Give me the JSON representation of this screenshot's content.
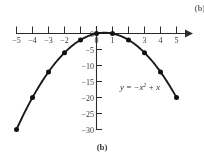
{
  "figure": {
    "part_label_top": "(b)",
    "part_label_bottom": "(b)",
    "equation_lead": "y = −x",
    "equation_exp": "2",
    "equation_tail": " + x"
  },
  "chart_data": {
    "type": "line",
    "title": "",
    "subtitle": "",
    "xlabel": "",
    "ylabel": "",
    "equation": "y = -x^2 + x",
    "grid": false,
    "legend": "none",
    "annotations": [
      {
        "text": "y = −x² + x",
        "x": 2.1,
        "y": -14.5
      },
      {
        "text": "(b)",
        "x": null,
        "y": null
      }
    ],
    "xlim": [
      -5,
      5.9
    ],
    "ylim": [
      -31.5,
      1.5
    ],
    "xticks": [
      -5,
      -4,
      -3,
      -2,
      -1,
      0,
      1,
      2,
      3,
      4,
      5
    ],
    "xticklabels": [
      "-5",
      "-4",
      "-3",
      "-2",
      "",
      "0",
      "1",
      "",
      "3",
      "4",
      "5"
    ],
    "yticks": [
      0,
      -5,
      -10,
      -15,
      -20,
      -25,
      -30
    ],
    "yticklabels": [
      "0",
      "-5",
      "-10",
      "-15",
      "-20",
      "-25",
      "-30"
    ],
    "x_axis_arrow": "right",
    "y_axis_arrow": "none",
    "markers": "filled-circle",
    "x": [
      -5,
      -4,
      -3,
      -2,
      -1,
      0,
      1,
      2,
      3,
      4,
      5
    ],
    "values": [
      -30,
      -20,
      -12,
      -6,
      -2,
      0,
      0,
      -2,
      -6,
      -12,
      -20
    ],
    "series": [
      {
        "name": "y = -x^2 + x",
        "x": [
          -5,
          -4,
          -3,
          -2,
          -1,
          0,
          1,
          2,
          3,
          4,
          5
        ],
        "values": [
          -30,
          -20,
          -12,
          -6,
          -2,
          0,
          0,
          -2,
          -6,
          -12,
          -20
        ]
      }
    ],
    "vertex": {
      "x": 0.5,
      "y": 0.25
    },
    "colors": {
      "curve": "#1a1a1a",
      "marker": "#111111",
      "axis": "#2b2b2b",
      "text": "#3a3a3a",
      "background": "#ffffff"
    }
  }
}
